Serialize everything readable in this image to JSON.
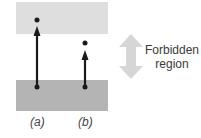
{
  "diagram": {
    "upper_band_color": "#dedede",
    "lower_band_color": "#b4b4b4",
    "arrow_color": "#1a1a1a",
    "forbidden_arrow_color": "#d6d6d6",
    "transitions": [
      {
        "label": "(a)",
        "reaches": "upper band"
      },
      {
        "label": "(b)",
        "reaches": "forbidden region"
      }
    ],
    "forbidden_label_line1": "Forbidden",
    "forbidden_label_line2": "region"
  }
}
